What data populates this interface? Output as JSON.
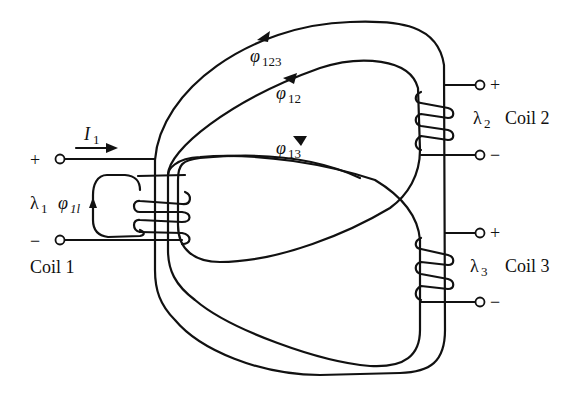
{
  "diagram": {
    "coils": [
      {
        "name": "Coil 1",
        "flux_linkage": "λ",
        "flux_linkage_sub": "1",
        "plus": "+",
        "minus": "−"
      },
      {
        "name": "Coil 2",
        "flux_linkage": "λ",
        "flux_linkage_sub": "2",
        "plus": "+",
        "minus": "−"
      },
      {
        "name": "Coil 3",
        "flux_linkage": "λ",
        "flux_linkage_sub": "3",
        "plus": "+",
        "minus": "−"
      }
    ],
    "current": {
      "symbol": "I",
      "sub": "1"
    },
    "fluxes": [
      {
        "symbol": "φ",
        "sub": "123"
      },
      {
        "symbol": "φ",
        "sub": "12"
      },
      {
        "symbol": "φ",
        "sub": "13"
      },
      {
        "symbol": "φ",
        "sub": "1l"
      }
    ],
    "colors": {
      "line": "#111111",
      "background": "#ffffff"
    }
  }
}
